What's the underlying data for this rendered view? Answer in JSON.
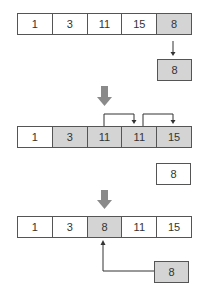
{
  "diagram": {
    "type": "insertion-sort-step",
    "colors": {
      "shaded": "#d4d4d4",
      "border": "#555555",
      "big_arrow": "#8a8a8a"
    },
    "step1": {
      "array": [
        {
          "value": "1",
          "shaded": false
        },
        {
          "value": "3",
          "shaded": false
        },
        {
          "value": "11",
          "shaded": false
        },
        {
          "value": "15",
          "shaded": false
        },
        {
          "value": "8",
          "shaded": true
        }
      ],
      "temp": {
        "value": "8",
        "shaded": true
      }
    },
    "step2": {
      "array": [
        {
          "value": "1",
          "shaded": false
        },
        {
          "value": "3",
          "shaded": true
        },
        {
          "value": "11",
          "shaded": true
        },
        {
          "value": "11",
          "shaded": true
        },
        {
          "value": "15",
          "shaded": true
        }
      ],
      "temp": {
        "value": "8",
        "shaded": false
      }
    },
    "step3": {
      "array": [
        {
          "value": "1",
          "shaded": false
        },
        {
          "value": "3",
          "shaded": false
        },
        {
          "value": "8",
          "shaded": true
        },
        {
          "value": "11",
          "shaded": false
        },
        {
          "value": "15",
          "shaded": false
        }
      ],
      "temp": {
        "value": "8",
        "shaded": true
      }
    }
  }
}
